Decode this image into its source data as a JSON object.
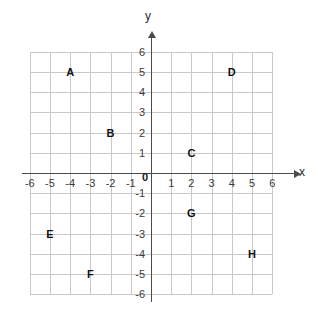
{
  "chart_data": {
    "type": "scatter",
    "title": "",
    "xlabel": "x",
    "ylabel": "y",
    "xlim": [
      -6,
      6
    ],
    "ylim": [
      -6,
      6
    ],
    "grid": true,
    "legend": "none",
    "x_ticks": [
      "-6",
      "-5",
      "-4",
      "-3",
      "-2",
      "-1",
      "1",
      "2",
      "3",
      "4",
      "5",
      "6"
    ],
    "y_ticks": [
      "6",
      "5",
      "4",
      "3",
      "2",
      "1",
      "-1",
      "-2",
      "-3",
      "-4",
      "-5",
      "-6"
    ],
    "origin_label": "0",
    "points": [
      {
        "label": "A",
        "x": -4,
        "y": 5
      },
      {
        "label": "B",
        "x": -2,
        "y": 2
      },
      {
        "label": "C",
        "x": 2,
        "y": 1
      },
      {
        "label": "D",
        "x": 4,
        "y": 5
      },
      {
        "label": "E",
        "x": -5,
        "y": -3
      },
      {
        "label": "F",
        "x": -3,
        "y": -5
      },
      {
        "label": "G",
        "x": 2,
        "y": -2
      },
      {
        "label": "H",
        "x": 5,
        "y": -4
      }
    ]
  },
  "colors": {
    "grid": "#c9c9c9",
    "axis": "#4a4a4a",
    "label": "#111111",
    "background": "#ffffff"
  }
}
